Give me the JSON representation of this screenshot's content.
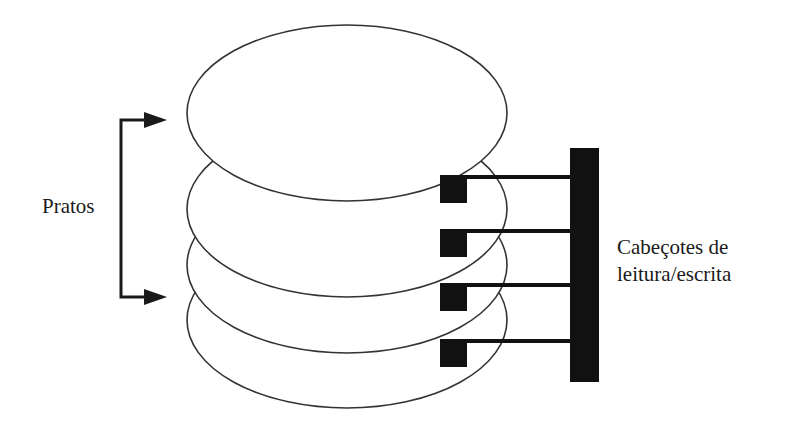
{
  "diagram": {
    "labels": {
      "platters": "Pratos",
      "heads_line1": "Cabeçotes de",
      "heads_line2": "leitura/escrita"
    },
    "platters": {
      "count": 4,
      "cx": 347,
      "rx": 160,
      "ry": 88,
      "centers_y": [
        113,
        170,
        226,
        283
      ],
      "stroke": "#333333",
      "fill": "#ffffff"
    },
    "heads": {
      "count": 4,
      "arm_y": [
        175,
        232,
        288,
        345
      ],
      "block_x": 440,
      "block_w": 27,
      "block_h": 28,
      "arm_end_x": 572,
      "color": "#111111"
    },
    "actuator": {
      "x": 570,
      "y": 148,
      "w": 29,
      "h": 234,
      "color": "#111111"
    },
    "bracket": {
      "x": 121,
      "top_y": 120,
      "bottom_y": 297,
      "arrow_tip_x": 167,
      "color": "#1a1a1a"
    }
  }
}
